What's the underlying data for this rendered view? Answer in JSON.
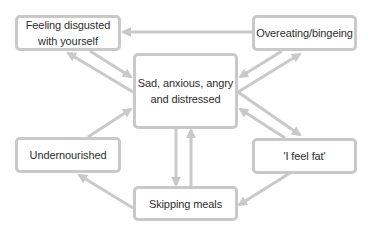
{
  "diagram": {
    "type": "cycle-diagram",
    "colors": {
      "border": "#c9c9c9",
      "arrow": "#c9c9c9",
      "text": "#2e2e2e",
      "background": "#ffffff"
    },
    "nodes": [
      {
        "id": "feeling_disgusted",
        "line1": "Feeling disgusted",
        "line2": "with yourself"
      },
      {
        "id": "overeating",
        "line1": "Overeating/bingeing",
        "line2": ""
      },
      {
        "id": "sad_anxious",
        "line1": "Sad, anxious, angry",
        "line2": "and distressed"
      },
      {
        "id": "undernourished",
        "line1": "Undernourished",
        "line2": ""
      },
      {
        "id": "feel_fat",
        "line1": "'I feel fat'",
        "line2": ""
      },
      {
        "id": "skipping_meals",
        "line1": "Skipping meals",
        "line2": ""
      }
    ],
    "edges": [
      {
        "from": "overeating",
        "to": "feeling_disgusted"
      },
      {
        "from": "feeling_disgusted",
        "to": "sad_anxious"
      },
      {
        "from": "sad_anxious",
        "to": "feeling_disgusted"
      },
      {
        "from": "overeating",
        "to": "sad_anxious"
      },
      {
        "from": "sad_anxious",
        "to": "overeating"
      },
      {
        "from": "sad_anxious",
        "to": "feel_fat"
      },
      {
        "from": "feel_fat",
        "to": "sad_anxious"
      },
      {
        "from": "sad_anxious",
        "to": "skipping_meals"
      },
      {
        "from": "skipping_meals",
        "to": "sad_anxious"
      },
      {
        "from": "undernourished",
        "to": "sad_anxious"
      },
      {
        "from": "skipping_meals",
        "to": "undernourished"
      },
      {
        "from": "feel_fat",
        "to": "skipping_meals"
      }
    ]
  }
}
